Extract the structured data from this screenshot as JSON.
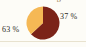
{
  "figure": {
    "title_clipped": "Verteilung",
    "background_color": "#fdfcf7",
    "rule_color": "#e8e2cf"
  },
  "labels": {
    "left": "63 %",
    "right": "37 %"
  },
  "chart_data": {
    "type": "pie",
    "title": "Verteilung",
    "categories": [
      "63 %",
      "37 %"
    ],
    "values": [
      63,
      37
    ],
    "value_labels": [
      "63 %",
      "37 %"
    ],
    "colors": [
      "#7b2318",
      "#f5b855"
    ],
    "start_angle_deg": 0,
    "direction": "clockwise",
    "legend": "none",
    "grid": false,
    "xlabel": "",
    "ylabel": ""
  }
}
